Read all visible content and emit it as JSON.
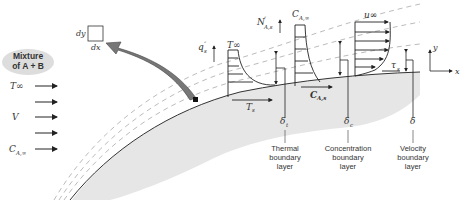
{
  "diagram": {
    "mixture_label": [
      "Mixture",
      "of A + B"
    ],
    "freestream_labels": {
      "temperature": "T∞",
      "velocity": "V",
      "concentration": "C",
      "concentration_sub": "A,∞"
    },
    "element": {
      "dy": "dy",
      "dx": "dx"
    },
    "heat_flux": {
      "symbol": "q",
      "sup": "″",
      "sub": "s"
    },
    "molar_flux": {
      "symbol": "N",
      "sup": "″",
      "sub": "A,s"
    },
    "profiles": {
      "thermal": {
        "top": "T∞",
        "bottom": "T",
        "bottom_sub": "s"
      },
      "concentration": {
        "top": "C",
        "top_sub": "A,∞",
        "bottom": "C",
        "bottom_sub": "A,s"
      },
      "velocity": {
        "top": "u∞",
        "shear": "τ",
        "shear_sub": "s"
      }
    },
    "deltas": {
      "thermal": {
        "symbol": "δ",
        "sub": "t"
      },
      "concentration": {
        "symbol": "δ",
        "sub": "c"
      },
      "velocity": {
        "symbol": "δ",
        "sub": ""
      }
    },
    "layer_labels": {
      "thermal": [
        "Thermal",
        "boundary",
        "layer"
      ],
      "concentration": [
        "Concentration",
        "boundary",
        "layer"
      ],
      "velocity": [
        "Velocity",
        "boundary",
        "layer"
      ]
    },
    "axes": {
      "x": "x",
      "y": "y"
    },
    "colors": {
      "surface": "#e8e8e8",
      "line": "#333333",
      "dashed": "#aaaaaa",
      "arrow_fill": "#777777"
    }
  }
}
